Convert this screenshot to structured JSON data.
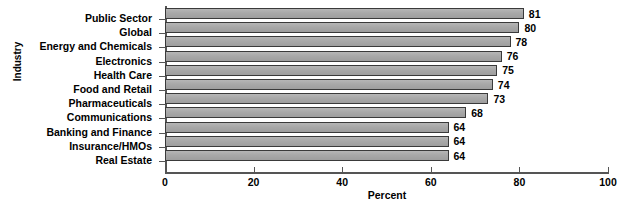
{
  "chart_data": {
    "type": "bar",
    "orientation": "horizontal",
    "title": "",
    "xlabel": "Percent",
    "ylabel": "Industry",
    "xlim": [
      0,
      100
    ],
    "xticks": [
      0,
      20,
      40,
      60,
      80,
      100
    ],
    "grid": false,
    "legend": null,
    "categories": [
      "Public Sector",
      "Global",
      "Energy and Chemicals",
      "Electronics",
      "Health Care",
      "Food and Retail",
      "Pharmaceuticals",
      "Communications",
      "Banking and Finance",
      "Insurance/HMOs",
      "Real Estate"
    ],
    "values": [
      81,
      80,
      78,
      76,
      75,
      74,
      73,
      68,
      64,
      64,
      64
    ],
    "value_labels": [
      "81",
      "80",
      "78",
      "76",
      "75",
      "74",
      "73",
      "68",
      "64",
      "64",
      "64"
    ],
    "xtick_labels": [
      "0",
      "20",
      "40",
      "60",
      "80",
      "100"
    ],
    "bar_fill_color": "#a8a8a8",
    "bar_border_color": "#3a3a3a",
    "axis_color": "#555555",
    "text_color": "#000000",
    "background_color": "#ffffff"
  }
}
